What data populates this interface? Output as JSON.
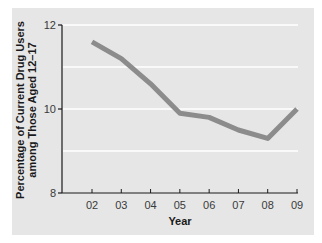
{
  "chart_data": {
    "type": "line",
    "title": "",
    "xlabel": "Year",
    "ylabel_lines": [
      "Percentage of Current Drug Users",
      "among Those Aged 12–17"
    ],
    "ylabel": "Percentage of Current Drug Users among Those Aged 12–17",
    "categories": [
      "02",
      "03",
      "04",
      "05",
      "06",
      "07",
      "08",
      "09"
    ],
    "series": [
      {
        "name": "Current drug users aged 12–17",
        "values": [
          11.6,
          11.2,
          10.6,
          9.9,
          9.8,
          9.5,
          9.3,
          10.0
        ],
        "color": "#8c8c8c"
      }
    ],
    "ylim": [
      8,
      12
    ],
    "yticks": [
      "8",
      "10",
      "12"
    ],
    "gridlines": [
      9,
      10,
      11,
      12
    ],
    "grid": true,
    "legend": "none",
    "colors": {
      "panel": "#e6e6e6",
      "grid": "#ffffff",
      "axis": "#1a1a1a",
      "line": "#8c8c8c"
    }
  }
}
